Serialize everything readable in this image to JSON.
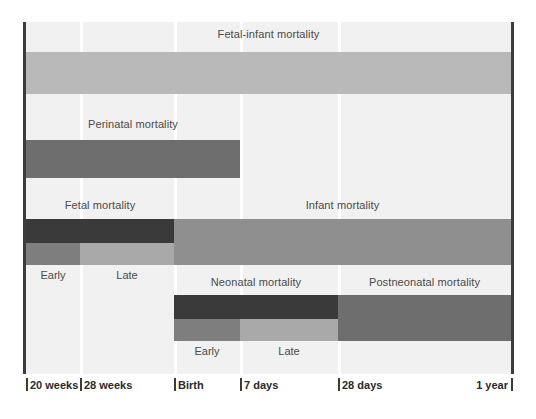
{
  "figure": {
    "type": "timeline-gantt"
  },
  "colors": {
    "background": "#f1f1f1",
    "page": "#ffffff",
    "gridline": "#ffffff",
    "axis_rule": "#3c3c3c",
    "band_lightest": "#b9b9b9",
    "band_light": "#a9a9a9",
    "band_medium": "#8f8f8f",
    "band_mediumdark": "#7e7e7e",
    "band_dark": "#6e6e6e",
    "band_darkest": "#3a3a3a",
    "label_text": "#4a4a4a",
    "axis_text": "#2a2a2a"
  },
  "axis": {
    "ticks": [
      {
        "label": "20 weeks",
        "x": 26,
        "align": "left"
      },
      {
        "label": "28 weeks",
        "x": 80,
        "align": "left"
      },
      {
        "label": "Birth",
        "x": 174,
        "align": "left"
      },
      {
        "label": "7 days",
        "x": 240,
        "align": "left"
      },
      {
        "label": "28 days",
        "x": 338,
        "align": "left"
      },
      {
        "label": "1 year",
        "x": 511,
        "align": "right"
      }
    ]
  },
  "gridlines_x": [
    80,
    174,
    240,
    338
  ],
  "rows": [
    {
      "id": "fetal-infant",
      "labels": [
        {
          "text": "Fetal-infant mortality",
          "left": 26,
          "width": 485,
          "top": 28
        }
      ],
      "bars": [
        {
          "name": "fetal-infant-mortality-bar",
          "left": 26,
          "width": 485,
          "top": 52,
          "height": 42,
          "color": "#b9b9b9"
        }
      ]
    },
    {
      "id": "perinatal",
      "labels": [
        {
          "text": "Perinatal mortality",
          "left": 26,
          "width": 214,
          "top": 118,
          "align": "center"
        }
      ],
      "bars": [
        {
          "name": "perinatal-mortality-bar",
          "left": 26,
          "width": 214,
          "top": 140,
          "height": 38,
          "color": "#6e6e6e"
        }
      ]
    },
    {
      "id": "fetal-infant-split",
      "labels": [
        {
          "text": "Fetal mortality",
          "left": 26,
          "width": 148,
          "top": 199,
          "align": "center"
        },
        {
          "text": "Infant mortality",
          "left": 174,
          "width": 337,
          "top": 199,
          "align": "center"
        }
      ],
      "bars": [
        {
          "name": "fetal-mortality-bar",
          "left": 26,
          "width": 148,
          "top": 219,
          "height": 24,
          "color": "#3a3a3a"
        },
        {
          "name": "infant-mortality-bar",
          "left": 174,
          "width": 337,
          "top": 219,
          "height": 46,
          "color": "#8f8f8f"
        },
        {
          "name": "fetal-early-bar",
          "left": 26,
          "width": 54,
          "top": 243,
          "height": 22,
          "color": "#7e7e7e"
        },
        {
          "name": "fetal-late-bar",
          "left": 80,
          "width": 94,
          "top": 243,
          "height": 22,
          "color": "#a9a9a9"
        }
      ],
      "sublabels": [
        {
          "text": "Early",
          "left": 26,
          "width": 54,
          "top": 269
        },
        {
          "text": "Late",
          "left": 80,
          "width": 94,
          "top": 269
        }
      ]
    },
    {
      "id": "neonatal-split",
      "labels": [
        {
          "text": "Neonatal mortality",
          "left": 174,
          "width": 164,
          "top": 276,
          "align": "center"
        },
        {
          "text": "Postneonatal mortality",
          "left": 338,
          "width": 173,
          "top": 276,
          "align": "center"
        }
      ],
      "bars": [
        {
          "name": "neonatal-mortality-bar",
          "left": 174,
          "width": 164,
          "top": 295,
          "height": 24,
          "color": "#3a3a3a"
        },
        {
          "name": "postneonatal-mortality-bar",
          "left": 338,
          "width": 173,
          "top": 295,
          "height": 46,
          "color": "#6e6e6e"
        },
        {
          "name": "neonatal-early-bar",
          "left": 174,
          "width": 66,
          "top": 319,
          "height": 22,
          "color": "#7e7e7e"
        },
        {
          "name": "neonatal-late-bar",
          "left": 240,
          "width": 98,
          "top": 319,
          "height": 22,
          "color": "#a9a9a9"
        }
      ],
      "sublabels": [
        {
          "text": "Early",
          "left": 174,
          "width": 66,
          "top": 345
        },
        {
          "text": "Late",
          "left": 240,
          "width": 98,
          "top": 345
        }
      ]
    }
  ],
  "chart_data": {
    "type": "table",
    "xlabel": "Time",
    "ylabel": "",
    "categories": [
      "20 weeks",
      "28 weeks",
      "Birth",
      "7 days",
      "28 days",
      "1 year"
    ],
    "grid": true,
    "legend": "none",
    "periods": [
      {
        "name": "Fetal-infant mortality",
        "start": "20 weeks",
        "end": "1 year"
      },
      {
        "name": "Perinatal mortality",
        "start": "20 weeks",
        "end": "7 days"
      },
      {
        "name": "Fetal mortality",
        "start": "20 weeks",
        "end": "Birth"
      },
      {
        "name": "Fetal mortality - Early",
        "start": "20 weeks",
        "end": "28 weeks"
      },
      {
        "name": "Fetal mortality - Late",
        "start": "28 weeks",
        "end": "Birth"
      },
      {
        "name": "Infant mortality",
        "start": "Birth",
        "end": "1 year"
      },
      {
        "name": "Neonatal mortality",
        "start": "Birth",
        "end": "28 days"
      },
      {
        "name": "Neonatal - Early",
        "start": "Birth",
        "end": "7 days"
      },
      {
        "name": "Neonatal - Late",
        "start": "7 days",
        "end": "28 days"
      },
      {
        "name": "Postneonatal mortality",
        "start": "28 days",
        "end": "1 year"
      }
    ]
  }
}
